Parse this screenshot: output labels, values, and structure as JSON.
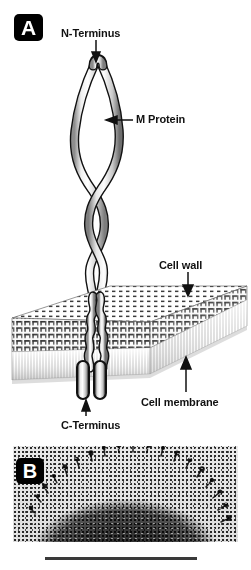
{
  "figure": {
    "panels": [
      {
        "id": "A",
        "label": "A",
        "type": "schematic",
        "description": "Schematic diagram of the streptococcal M protein coiled-coil dimer anchored in the cell wall and cell membrane"
      },
      {
        "id": "B",
        "label": "B",
        "type": "electron-micrograph",
        "description": "Electron micrograph of a bacterial cell surface showing fibrillar M protein projections"
      }
    ]
  },
  "panel_a": {
    "chip_label": "A",
    "annotations": [
      {
        "name": "n-terminus",
        "text": "N-Terminus",
        "arrow": "down",
        "label_x": 61,
        "label_y": 27,
        "tip_x": 96,
        "tip_y": 62
      },
      {
        "name": "m-protein",
        "text": "M Protein",
        "arrow": "left",
        "label_x": 136,
        "label_y": 113,
        "tip_x": 103,
        "tip_y": 120
      },
      {
        "name": "cell-wall",
        "text": "Cell wall",
        "arrow": "down",
        "label_x": 159,
        "label_y": 259,
        "tip_x": 188,
        "tip_y": 295
      },
      {
        "name": "cell-membrane",
        "text": "Cell membrane",
        "arrow": "up",
        "label_x": 141,
        "label_y": 396,
        "tip_x": 186,
        "tip_y": 357
      },
      {
        "name": "c-terminus",
        "text": "C-Terminus",
        "arrow": "up",
        "label_x": 61,
        "label_y": 419,
        "tip_x": 86,
        "tip_y": 400
      }
    ],
    "structures": [
      {
        "name": "coiled-coil-dimer",
        "strands": 2
      },
      {
        "name": "cell-wall-slab",
        "texture": "cross-hatched-grid"
      },
      {
        "name": "cell-membrane-slab",
        "texture": "vertical-striped-bilayer"
      },
      {
        "name": "membrane-anchor",
        "segments": 2
      }
    ]
  },
  "panel_b": {
    "chip_label": "B",
    "scale_bar": {
      "name": "scale-bar",
      "visible": true
    }
  },
  "colors": {
    "background": "#ffffff",
    "ink": "#111111",
    "chip_background": "#000000",
    "chip_text": "#ffffff",
    "protein_fill": "#f2f2f2",
    "protein_outline": "#111111",
    "cell_wall": "#4a4a4a",
    "cell_membrane": "#bdbdbd",
    "scale_bar": "#3a3a3a"
  }
}
